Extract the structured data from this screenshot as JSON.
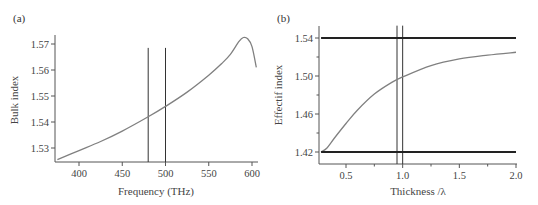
{
  "chart_data": [
    {
      "type": "line",
      "panel_label": "(a)",
      "title": "",
      "xlabel": "Frequency (THz)",
      "ylabel": "Bulk index",
      "xlim": [
        375,
        605
      ],
      "ylim": [
        1.525,
        1.574
      ],
      "x_ticks": [
        400,
        450,
        500,
        550,
        600
      ],
      "x_tick_labels": [
        "400",
        "450",
        "500",
        "550",
        "600"
      ],
      "y_ticks": [
        1.53,
        1.54,
        1.55,
        1.56,
        1.57
      ],
      "y_tick_labels": [
        "1.53",
        "1.54",
        "1.55",
        "1.56",
        "1.57"
      ],
      "grid": false,
      "series": [
        {
          "name": "bulk index",
          "color": "#808080",
          "x": [
            375,
            400,
            425,
            450,
            480,
            500,
            525,
            550,
            565,
            575,
            585,
            590,
            595,
            600,
            605
          ],
          "y": [
            1.5255,
            1.529,
            1.5325,
            1.5365,
            1.542,
            1.546,
            1.5515,
            1.558,
            1.5625,
            1.566,
            1.571,
            1.5725,
            1.572,
            1.569,
            1.561
          ]
        }
      ],
      "vertical_lines": [
        {
          "x": 480,
          "y_top": 1.5685,
          "color": "#333333"
        },
        {
          "x": 500,
          "y_top": 1.5685,
          "color": "#333333"
        }
      ]
    },
    {
      "type": "line",
      "panel_label": "(b)",
      "title": "",
      "xlabel": "Thickness /λ",
      "ylabel": "Effectif index",
      "xlim": [
        0.25,
        2.0
      ],
      "ylim": [
        1.407,
        1.553
      ],
      "x_ticks": [
        0.5,
        1.0,
        1.5,
        2.0
      ],
      "x_tick_labels": [
        "0.5",
        "1.0",
        "1.5",
        "2.0"
      ],
      "x_minor_ticks": [
        0.75,
        1.25,
        1.75
      ],
      "y_ticks": [
        1.42,
        1.46,
        1.5,
        1.54
      ],
      "y_tick_labels": [
        "1.42",
        "1.46",
        "1.50",
        "1.54"
      ],
      "y_minor_ticks": [
        1.44,
        1.48,
        1.52
      ],
      "grid": false,
      "series": [
        {
          "name": "effective index",
          "color": "#808080",
          "x": [
            0.28,
            0.33,
            0.4,
            0.5,
            0.6,
            0.75,
            0.9,
            1.0,
            1.25,
            1.5,
            1.75,
            2.0
          ],
          "y": [
            1.42,
            1.424,
            1.435,
            1.45,
            1.464,
            1.481,
            1.493,
            1.499,
            1.511,
            1.518,
            1.522,
            1.525
          ]
        },
        {
          "name": "upper bound (1.54)",
          "color": "#222222",
          "x": [
            0.28,
            2.0
          ],
          "y": [
            1.54,
            1.54
          ]
        },
        {
          "name": "lower bound (1.42)",
          "color": "#222222",
          "x": [
            0.28,
            2.0
          ],
          "y": [
            1.42,
            1.42
          ]
        }
      ],
      "vertical_lines": [
        {
          "x": 0.95,
          "y_top": 1.553,
          "color": "#333333"
        },
        {
          "x": 1.0,
          "y_top": 1.553,
          "color": "#333333"
        }
      ]
    }
  ]
}
